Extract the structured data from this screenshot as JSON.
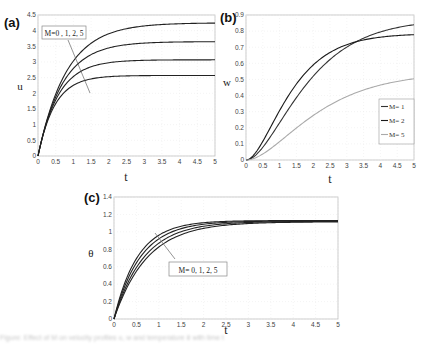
{
  "figure": {
    "caption_note": "illegible blurred caption text"
  },
  "chart_data": [
    {
      "panel": "(a)",
      "type": "line",
      "title": "",
      "xlabel": "t",
      "ylabel": "u",
      "xlim": [
        0,
        5
      ],
      "ylim": [
        0,
        4.5
      ],
      "xticks": [
        "0",
        "0.5",
        "1",
        "1.5",
        "2",
        "2.5",
        "3",
        "3.5",
        "4",
        "4.5",
        "5"
      ],
      "yticks": [
        "0",
        "0.5",
        "1",
        "1.5",
        "2",
        "2.5",
        "3",
        "3.5",
        "4",
        "4.5"
      ],
      "grid": true,
      "annotation": "M=0 , 1, 2, 5",
      "series": [
        {
          "name": "M=0",
          "model": "sat",
          "asymptote": 4.25,
          "rate": 1.25,
          "color": "#222222"
        },
        {
          "name": "M=1",
          "model": "sat",
          "asymptote": 3.65,
          "rate": 1.45,
          "color": "#222222"
        },
        {
          "name": "M=2",
          "model": "sat",
          "asymptote": 3.07,
          "rate": 1.75,
          "color": "#222222"
        },
        {
          "name": "M=5",
          "model": "sat",
          "asymptote": 2.57,
          "rate": 2.1,
          "color": "#222222"
        }
      ]
    },
    {
      "panel": "(b)",
      "type": "line",
      "title": "",
      "xlabel": "t",
      "ylabel": "w",
      "xlim": [
        0,
        5
      ],
      "ylim": [
        0,
        0.9
      ],
      "xticks": [
        "0",
        "0.5",
        "1",
        "1.5",
        "2",
        "2.5",
        "3",
        "3.5",
        "4",
        "4.5",
        "5"
      ],
      "yticks": [
        "0",
        "0.1",
        "0.2",
        "0.3",
        "0.4",
        "0.5",
        "0.6",
        "0.7",
        "0.8",
        "0.9"
      ],
      "grid": true,
      "legend": {
        "position": "lower right",
        "entries": [
          "M= 1",
          "M= 2",
          "M= 5"
        ]
      },
      "series": [
        {
          "name": "M= 1",
          "model": "sig",
          "asymptote": 0.875,
          "rate": 1.0,
          "color": "#333333"
        },
        {
          "name": "M= 2",
          "model": "sig",
          "asymptote": 0.785,
          "rate": 1.35,
          "color": "#1a1a1a"
        },
        {
          "name": "M= 5",
          "model": "sig",
          "asymptote": 0.545,
          "rate": 0.85,
          "color": "#aaaaaa"
        }
      ]
    },
    {
      "panel": "(c)",
      "type": "line",
      "title": "",
      "xlabel": "t",
      "ylabel": "θ",
      "xlim": [
        0,
        5
      ],
      "ylim": [
        0,
        1.4
      ],
      "xticks": [
        "0",
        "0.5",
        "1",
        "1.5",
        "2",
        "2.5",
        "3",
        "3.5",
        "4",
        "4.5",
        "5"
      ],
      "yticks": [
        "0",
        "0.2",
        "0.4",
        "0.6",
        "0.8",
        "1",
        "1.2",
        "1.4"
      ],
      "grid": true,
      "annotation": "M= 0, 1, 2, 5",
      "series": [
        {
          "name": "M=0",
          "model": "sat",
          "asymptote": 1.13,
          "rate": 1.9,
          "color": "#222222"
        },
        {
          "name": "M=1",
          "model": "sat",
          "asymptote": 1.125,
          "rate": 1.7,
          "color": "#222222"
        },
        {
          "name": "M=2",
          "model": "sat",
          "asymptote": 1.12,
          "rate": 1.5,
          "color": "#222222"
        },
        {
          "name": "M=5",
          "model": "sat",
          "asymptote": 1.115,
          "rate": 1.35,
          "color": "#222222"
        }
      ]
    }
  ],
  "labels": {
    "panel_a": "(a)",
    "panel_b": "(b)",
    "panel_c": "(c)",
    "caption": "Figure: Effect of M on velocity profiles u, w and temperature θ with time t"
  }
}
